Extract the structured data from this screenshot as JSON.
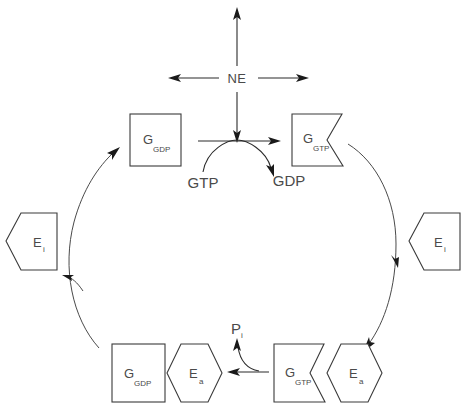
{
  "diagram": {
    "colors": {
      "background": "#ffffff",
      "stroke": "#3a3a3a",
      "arrow": "#2b2b2b",
      "arc": "#4a4a4a",
      "text": "#4a4a4a"
    },
    "labels": {
      "ne": "NE",
      "gtp_free": "GTP",
      "gdp_free": "GDP",
      "pi_base": "P",
      "pi_sub": "i",
      "g_letter": "G",
      "gdp_sub": "GDP",
      "gtp_sub": "GTP",
      "e_letter": "E",
      "ei_sub": "i",
      "ea_sub": "a"
    },
    "nodes": [
      {
        "id": "g-gdp-top",
        "shape": "rectangle",
        "base": "G",
        "sub": "GDP",
        "position": "top-left"
      },
      {
        "id": "g-gtp-top",
        "shape": "notched-rectangle",
        "base": "G",
        "sub": "GTP",
        "position": "top-right"
      },
      {
        "id": "ei-left",
        "shape": "pentagon-point-left",
        "base": "E",
        "sub": "i",
        "position": "mid-left"
      },
      {
        "id": "ei-right",
        "shape": "pentagon-point-left",
        "base": "E",
        "sub": "i",
        "position": "mid-right"
      },
      {
        "id": "g-gdp-bottom",
        "shape": "rectangle",
        "base": "G",
        "sub": "GDP",
        "position": "bottom-left"
      },
      {
        "id": "ea-left",
        "shape": "hexagon",
        "base": "E",
        "sub": "a",
        "position": "bottom-left"
      },
      {
        "id": "g-gtp-bottom",
        "shape": "notched-rectangle",
        "base": "G",
        "sub": "GTP",
        "position": "bottom-right"
      },
      {
        "id": "ea-right",
        "shape": "hexagon",
        "base": "E",
        "sub": "a",
        "position": "bottom-right"
      }
    ],
    "arrows": [
      {
        "id": "ne-up",
        "direction": "up",
        "from": "NE",
        "to": "outward"
      },
      {
        "id": "ne-left",
        "direction": "left",
        "from": "NE",
        "to": "outward"
      },
      {
        "id": "ne-right",
        "direction": "right",
        "from": "NE",
        "to": "outward"
      },
      {
        "id": "ne-down",
        "direction": "down",
        "from": "NE",
        "to": "exchange-step"
      },
      {
        "id": "exchange",
        "direction": "right",
        "from": "g-gdp-top",
        "to": "g-gtp-top"
      },
      {
        "id": "gtp-in-gdp-out",
        "direction": "arc-right",
        "from": "GTP",
        "to": "GDP"
      },
      {
        "id": "right-arc",
        "direction": "clockwise-down",
        "from": "g-gtp-top",
        "to": "g-gtp-bottom"
      },
      {
        "id": "bottom-arrow",
        "direction": "left",
        "from": "g-gtp-bottom-complex",
        "to": "g-gdp-bottom-complex"
      },
      {
        "id": "pi-release",
        "direction": "up",
        "from": "hydrolysis",
        "to": "Pi"
      },
      {
        "id": "left-arc",
        "direction": "clockwise-up",
        "from": "g-gdp-bottom",
        "to": "g-gdp-top"
      }
    ]
  }
}
